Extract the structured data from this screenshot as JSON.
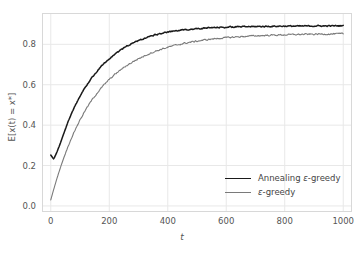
{
  "chart_data": {
    "type": "line",
    "title": "",
    "xlabel": "t",
    "ylabel": "E[x(t) = x*]",
    "xlim": [
      -30,
      1030
    ],
    "ylim": [
      -0.03,
      0.955
    ],
    "xticks": [
      0,
      200,
      400,
      600,
      800,
      1000
    ],
    "yticks": [
      0.0,
      0.2,
      0.4,
      0.6,
      0.8
    ],
    "xtick_labels": [
      "0",
      "200",
      "400",
      "600",
      "800",
      "1000"
    ],
    "ytick_labels": [
      "0.0",
      "0.2",
      "0.4",
      "0.6",
      "0.8"
    ],
    "grid": true,
    "grid_color": "#e8e8e8",
    "background": "#ffffff",
    "legend_position": "lower right",
    "series": [
      {
        "name": "Annealing ε-greedy",
        "color": "#1a1a1a",
        "x": [
          0,
          10,
          20,
          30,
          40,
          50,
          60,
          70,
          80,
          90,
          100,
          120,
          140,
          160,
          180,
          200,
          220,
          240,
          260,
          280,
          300,
          340,
          380,
          420,
          460,
          500,
          550,
          600,
          650,
          700,
          750,
          800,
          850,
          900,
          950,
          1000
        ],
        "values": [
          0.252,
          0.232,
          0.263,
          0.3,
          0.34,
          0.381,
          0.42,
          0.455,
          0.487,
          0.516,
          0.543,
          0.592,
          0.634,
          0.67,
          0.702,
          0.729,
          0.753,
          0.773,
          0.791,
          0.806,
          0.819,
          0.84,
          0.855,
          0.865,
          0.872,
          0.877,
          0.882,
          0.885,
          0.887,
          0.888,
          0.889,
          0.89,
          0.89,
          0.891,
          0.891,
          0.892
        ]
      },
      {
        "name": "ε-greedy",
        "color": "#7a7a7a",
        "x": [
          0,
          10,
          20,
          30,
          40,
          50,
          60,
          70,
          80,
          90,
          100,
          120,
          140,
          160,
          180,
          200,
          220,
          240,
          260,
          280,
          300,
          340,
          380,
          420,
          460,
          500,
          550,
          600,
          650,
          700,
          750,
          800,
          850,
          900,
          950,
          1000
        ],
        "values": [
          0.03,
          0.082,
          0.131,
          0.177,
          0.22,
          0.26,
          0.298,
          0.333,
          0.366,
          0.397,
          0.426,
          0.478,
          0.523,
          0.562,
          0.596,
          0.626,
          0.652,
          0.675,
          0.695,
          0.713,
          0.729,
          0.756,
          0.777,
          0.793,
          0.806,
          0.816,
          0.826,
          0.833,
          0.838,
          0.842,
          0.845,
          0.847,
          0.849,
          0.85,
          0.851,
          0.852
        ]
      }
    ],
    "noise": [
      {
        "name": "Annealing ε-greedy",
        "amplitude": 0.009
      },
      {
        "name": "ε-greedy",
        "amplitude": 0.011
      }
    ]
  },
  "legend": {
    "entries": [
      {
        "label": "Annealing ε-greedy",
        "color": "#1a1a1a",
        "linewidth": 1.6
      },
      {
        "label": "ε-greedy",
        "color": "#7a7a7a",
        "linewidth": 1.2
      }
    ]
  }
}
